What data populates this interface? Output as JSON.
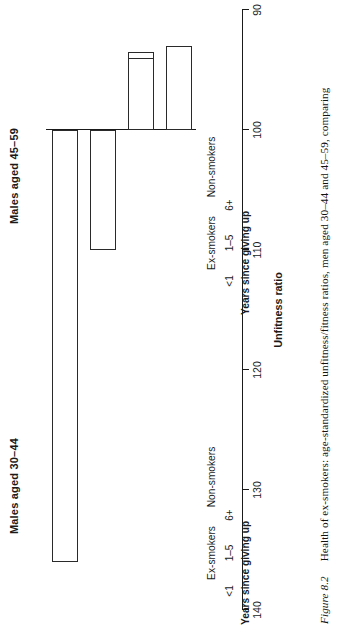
{
  "figure": {
    "number": "Figure 8.2",
    "caption": "Health of ex-smokers: age-standardized unfitness/fitness ratios, men aged 30–44 and 45–59, comparing"
  },
  "chart_data": {
    "type": "bar",
    "orientation": "horizontal",
    "title": "Health of ex-smokers: age-standardized unfitness/fitness ratios",
    "xlabel": "Unfitness ratio",
    "ylabel": "",
    "xlim": [
      140,
      90
    ],
    "ticks": [
      "140",
      "130",
      "120",
      "110",
      "100",
      "90"
    ],
    "tick_values": [
      140,
      130,
      120,
      110,
      100,
      90
    ],
    "baseline": 100,
    "grid": false,
    "legend": false,
    "group_label": "Years since giving up",
    "categories": [
      "<1",
      "1–5",
      "6+",
      "Non-smokers"
    ],
    "group_headers": [
      "Ex-smokers",
      "Non-smokers"
    ],
    "panels": [
      {
        "title": "Males aged 30–44",
        "categories": [
          "<1",
          "1–5",
          "6+",
          "Non-smokers"
        ],
        "values": [
          120,
          101,
          93.5,
          94.5
        ]
      },
      {
        "title": "Males aged 45–59",
        "categories": [
          "<1",
          "1–5",
          "6+",
          "Non-smokers"
        ],
        "values": [
          136,
          110,
          94,
          93
        ]
      }
    ]
  }
}
